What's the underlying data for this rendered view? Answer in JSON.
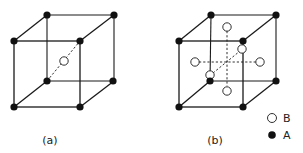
{
  "figure": {
    "panels": [
      {
        "id": "a",
        "caption": "(a)",
        "description": "Body-centered cubic cell: A atoms at 8 corners, B atom at body center",
        "corner_atoms": "A",
        "center_atoms": [
          "B (body center)"
        ]
      },
      {
        "id": "b",
        "caption": "(b)",
        "description": "Face-centered arrangement: A atoms at 8 corners, B atoms at 6 face centers",
        "corner_atoms": "A",
        "center_atoms": [
          "B top",
          "B bottom",
          "B left",
          "B right",
          "B front",
          "B back"
        ]
      }
    ],
    "legend": [
      {
        "symbol": "open-circle",
        "label": "B"
      },
      {
        "symbol": "filled-circle",
        "label": "A"
      }
    ],
    "colors": {
      "line": "#1a1a1a",
      "atom_a": "#111111",
      "atom_b_fill": "#ffffff"
    }
  }
}
